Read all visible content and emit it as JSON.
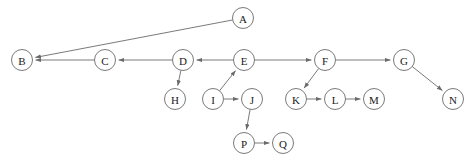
{
  "diagram": {
    "type": "directed-graph",
    "title": "",
    "canvas": {
      "width": 476,
      "height": 163,
      "background": "#ffffff"
    },
    "style": {
      "node_radius": 10.5,
      "node_fill": "#ffffff",
      "node_stroke": "#6b6b6b",
      "edge_stroke": "#6b6b6b",
      "label_color": "#1a1a1a",
      "arrowhead": "filled-triangle"
    },
    "nodes": [
      {
        "id": "A",
        "label": "A",
        "x": 243,
        "y": 18
      },
      {
        "id": "B",
        "label": "B",
        "x": 22,
        "y": 60
      },
      {
        "id": "C",
        "label": "C",
        "x": 105,
        "y": 60
      },
      {
        "id": "D",
        "label": "D",
        "x": 183,
        "y": 60
      },
      {
        "id": "E",
        "label": "E",
        "x": 244,
        "y": 60
      },
      {
        "id": "F",
        "label": "F",
        "x": 325,
        "y": 60
      },
      {
        "id": "G",
        "label": "G",
        "x": 404,
        "y": 60
      },
      {
        "id": "H",
        "label": "H",
        "x": 175,
        "y": 99
      },
      {
        "id": "I",
        "label": "I",
        "x": 213,
        "y": 99
      },
      {
        "id": "J",
        "label": "J",
        "x": 252,
        "y": 99
      },
      {
        "id": "K",
        "label": "K",
        "x": 296,
        "y": 99
      },
      {
        "id": "L",
        "label": "L",
        "x": 335,
        "y": 99
      },
      {
        "id": "M",
        "label": "M",
        "x": 374,
        "y": 99
      },
      {
        "id": "N",
        "label": "N",
        "x": 453,
        "y": 99
      },
      {
        "id": "P",
        "label": "P",
        "x": 244,
        "y": 143
      },
      {
        "id": "Q",
        "label": "Q",
        "x": 283,
        "y": 143
      }
    ],
    "edges": [
      {
        "from": "A",
        "to": "B",
        "directed": true
      },
      {
        "from": "C",
        "to": "B",
        "directed": true
      },
      {
        "from": "D",
        "to": "C",
        "directed": true
      },
      {
        "from": "E",
        "to": "D",
        "directed": true
      },
      {
        "from": "D",
        "to": "H",
        "directed": true
      },
      {
        "from": "I",
        "to": "E",
        "directed": true
      },
      {
        "from": "I",
        "to": "J",
        "directed": true
      },
      {
        "from": "J",
        "to": "P",
        "directed": true
      },
      {
        "from": "P",
        "to": "Q",
        "directed": true
      },
      {
        "from": "E",
        "to": "F",
        "directed": true
      },
      {
        "from": "F",
        "to": "K",
        "directed": true
      },
      {
        "from": "K",
        "to": "L",
        "directed": true
      },
      {
        "from": "L",
        "to": "M",
        "directed": true
      },
      {
        "from": "F",
        "to": "G",
        "directed": true
      },
      {
        "from": "G",
        "to": "N",
        "directed": true
      }
    ]
  }
}
